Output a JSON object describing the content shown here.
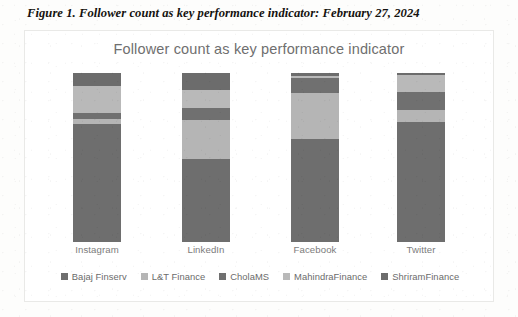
{
  "caption": "Figure 1. Follower count as key performance indicator: February 27, 2024",
  "chart_data": {
    "type": "bar",
    "stacked": true,
    "stack_mode": "percent",
    "title": "Follower count as key performance indicator",
    "xlabel": "",
    "ylabel": "",
    "grid": false,
    "axis_visible": false,
    "ylim": [
      0,
      100
    ],
    "legend_position": "bottom",
    "categories": [
      "Instagram",
      "LinkedIn",
      "Facebook",
      "Twitter"
    ],
    "series": [
      {
        "name": "Bajaj Finserv",
        "color": "#6e6e6e",
        "values": [
          70.0,
          49.0,
          61.0,
          71.0
        ]
      },
      {
        "name": "L&T Finance",
        "color": "#b5b5b5",
        "values": [
          3.0,
          23.0,
          27.0,
          7.0
        ]
      },
      {
        "name": "CholaMS",
        "color": "#707070",
        "values": [
          3.5,
          7.0,
          9.0,
          11.0
        ]
      },
      {
        "name": "MahindraFinance",
        "color": "#b9b9b9",
        "values": [
          16.0,
          11.0,
          1.0,
          10.0
        ]
      },
      {
        "name": "ShriramFinance",
        "color": "#6c6c6c",
        "values": [
          7.5,
          10.0,
          2.0,
          1.0
        ]
      }
    ]
  },
  "colors": {
    "title_text": "#6f6f6f",
    "label_text": "#7c7c7c",
    "legend_text": "#6b6b6b",
    "card_border": "#e9e9e7",
    "page_background": "#fdfdfc"
  }
}
